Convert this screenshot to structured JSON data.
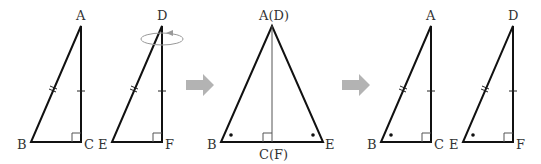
{
  "figure": {
    "colors": {
      "lines": "#111111",
      "arrow": "#b3b3b3",
      "labels": "#333333",
      "rotation": "#999999"
    },
    "step1": {
      "triangle_abc": {
        "labels": {
          "A": "A",
          "B": "B",
          "C": "C"
        },
        "marks": [
          "hypotenuse AB double tick",
          "leg AC single tick",
          "right angle at C"
        ]
      },
      "triangle_def": {
        "labels": {
          "D": "D",
          "E": "E",
          "F": "F"
        },
        "marks": [
          "hypotenuse DE double tick",
          "leg DF single tick",
          "right angle at F"
        ],
        "rotation_indicator": "rotation-arrow-icon"
      }
    },
    "arrow1": "right-arrow-icon",
    "step2": {
      "labels": {
        "apex": "A(D)",
        "left": "B",
        "right": "E",
        "foot": "C(F)"
      },
      "marks": [
        "right angle at C(F)",
        "equal angle dot at B",
        "equal angle dot at E"
      ]
    },
    "arrow2": "right-arrow-icon",
    "step3": {
      "triangle_abc": {
        "labels": {
          "A": "A",
          "B": "B",
          "C": "C"
        },
        "marks": [
          "double tick AB",
          "single tick AC",
          "right angle C",
          "dot at B"
        ]
      },
      "triangle_def": {
        "labels": {
          "D": "D",
          "E": "E",
          "F": "F"
        },
        "marks": [
          "double tick DE",
          "single tick DF",
          "right angle F",
          "dot at E"
        ]
      }
    }
  }
}
